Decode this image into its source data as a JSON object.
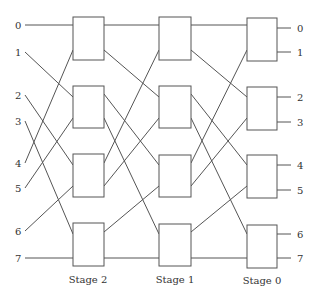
{
  "diagram": {
    "title": "",
    "type": "omega-style multistage interconnection network",
    "inputs": [
      "0",
      "1",
      "2",
      "3",
      "4",
      "5",
      "6",
      "7"
    ],
    "outputs": [
      "0",
      "1",
      "2",
      "3",
      "4",
      "5",
      "6",
      "7"
    ],
    "stages": [
      {
        "label": "Stage 2",
        "switches": 4
      },
      {
        "label": "Stage 1",
        "switches": 4
      },
      {
        "label": "Stage 0",
        "switches": 4
      }
    ],
    "input_connections": [
      {
        "input": "0",
        "to": "Stage 2 switch 1 port 0"
      },
      {
        "input": "1",
        "to": "Stage 2 switch 2 port 0"
      },
      {
        "input": "2",
        "to": "Stage 2 switch 3 port 0"
      },
      {
        "input": "3",
        "to": "Stage 2 switch 4 port 0"
      },
      {
        "input": "4",
        "to": "Stage 2 switch 1 port 1"
      },
      {
        "input": "5",
        "to": "Stage 2 switch 2 port 1"
      },
      {
        "input": "6",
        "to": "Stage 2 switch 3 port 1"
      },
      {
        "input": "7",
        "to": "Stage 2 switch 4 port 1"
      }
    ],
    "interstage_pattern": "perfect shuffle"
  }
}
